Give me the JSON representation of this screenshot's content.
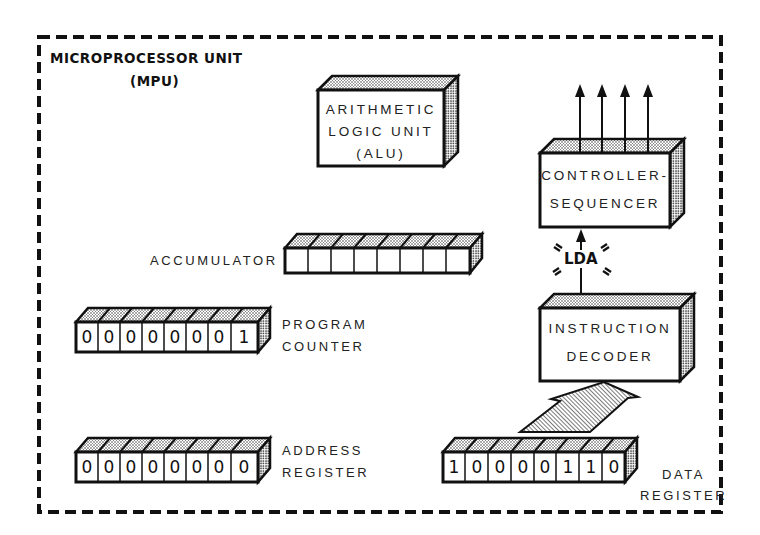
{
  "title": {
    "line1": "MICROPROCESSOR UNIT",
    "line2": "(MPU)"
  },
  "alu": {
    "line1": "ARITHMETIC",
    "line2": "LOGIC UNIT",
    "line3": "(ALU)"
  },
  "controller": {
    "line1": "CONTROLLER-",
    "line2": "SEQUENCER",
    "output_arrows": 4
  },
  "signal": {
    "label": "LDA"
  },
  "decoder": {
    "line1": "INSTRUCTION",
    "line2": "DECODER"
  },
  "accumulator": {
    "label": "ACCUMULATOR",
    "bits": [
      "",
      "",
      "",
      "",
      "",
      "",
      "",
      ""
    ]
  },
  "program_counter": {
    "line1": "PROGRAM",
    "line2": "COUNTER",
    "bits": [
      "0",
      "0",
      "0",
      "0",
      "0",
      "0",
      "0",
      "1"
    ]
  },
  "address_register": {
    "line1": "ADDRESS",
    "line2": "REGISTER",
    "bits": [
      "0",
      "0",
      "0",
      "0",
      "0",
      "0",
      "0",
      "0"
    ]
  },
  "data_register": {
    "line1": "DATA",
    "line2": "REGISTER",
    "bits": [
      "1",
      "0",
      "0",
      "0",
      "0",
      "1",
      "1",
      "0"
    ]
  },
  "colors": {
    "ink": "#111111",
    "background": "#ffffff"
  }
}
